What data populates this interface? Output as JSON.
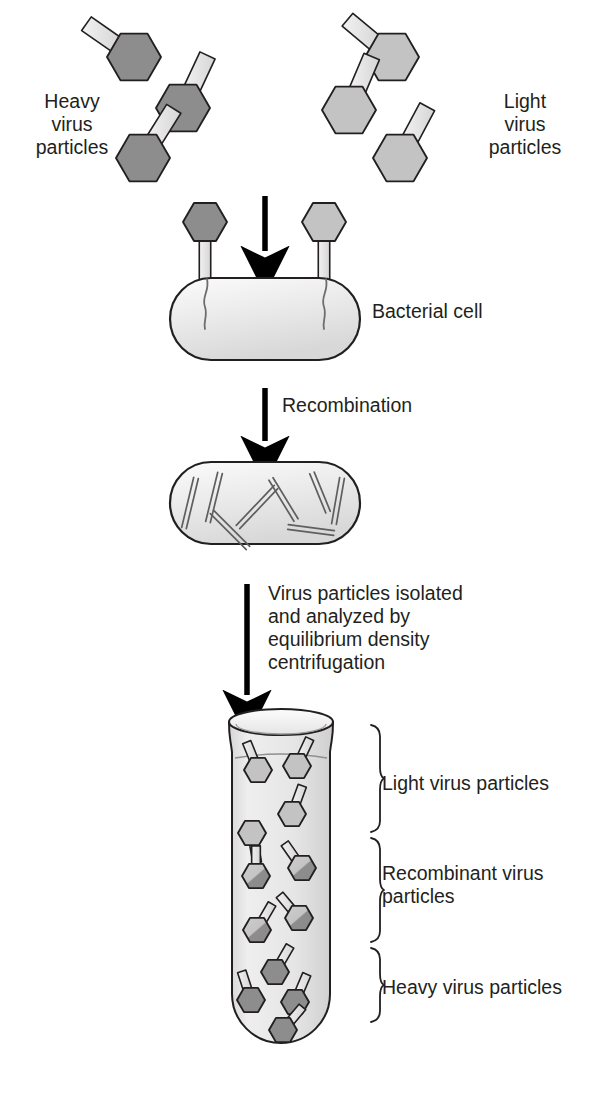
{
  "figure": {
    "background": "#ffffff"
  },
  "colors": {
    "heavy_head": "#8d8d8d",
    "light_head": "#c3c3c3",
    "recombinant_light": "#c9c9c9",
    "recombinant_dark": "#8d8d8d",
    "tail_fill": "#e3e3e3",
    "cell_fill": "#ebebeb",
    "tube_fill": "#e6e6e6",
    "outline": "#231f20",
    "text": "#231f20",
    "arrow": "#000000"
  },
  "labels": {
    "heavy_particles": [
      "Heavy",
      "virus",
      "particles"
    ],
    "light_particles": [
      "Light",
      "virus",
      "particles"
    ],
    "bacterial_cell": "Bacterial cell",
    "recombination": "Recombination",
    "centrifugation": [
      "Virus particles isolated",
      "and analyzed by",
      "equilibrium density",
      "centrifugation"
    ],
    "band_light": [
      "Light virus particles"
    ],
    "band_recombinant": [
      "Recombinant virus",
      "particles"
    ],
    "band_heavy": [
      "Heavy virus particles"
    ]
  },
  "top_particles": {
    "heavy": [
      {
        "cx": 134,
        "cy": 57,
        "r": 27,
        "tail_angle": 215
      },
      {
        "cx": 183,
        "cy": 108,
        "r": 27,
        "tail_angle": 295
      },
      {
        "cx": 143,
        "cy": 158,
        "r": 27,
        "tail_angle": 302
      }
    ],
    "light": [
      {
        "cx": 392,
        "cy": 57,
        "r": 27,
        "tail_angle": 220
      },
      {
        "cx": 349,
        "cy": 110,
        "r": 27,
        "tail_angle": 293
      },
      {
        "cx": 400,
        "cy": 158,
        "r": 27,
        "tail_angle": 298
      }
    ]
  },
  "infection": {
    "cell": {
      "x": 170,
      "y": 278,
      "width": 190,
      "height": 82,
      "label_x": 372,
      "label_y": 318
    },
    "phages": [
      {
        "type": "heavy",
        "cx": 205,
        "cy": 222,
        "r": 22
      },
      {
        "type": "light",
        "cx": 324,
        "cy": 222,
        "r": 22
      }
    ],
    "arrow": {
      "x": 265,
      "y_start": 196,
      "y_end": 262
    }
  },
  "recombination_stage": {
    "cell": {
      "x": 170,
      "y": 462,
      "width": 190,
      "height": 82
    },
    "arrow": {
      "x": 265,
      "y_start": 388,
      "y_end": 452
    },
    "label_x": 282,
    "label_y": 412,
    "dna_segments": [
      {
        "x1": 196,
        "y1": 478,
        "x2": 184,
        "y2": 528
      },
      {
        "x1": 220,
        "y1": 473,
        "x2": 208,
        "y2": 522
      },
      {
        "x1": 212,
        "y1": 512,
        "x2": 248,
        "y2": 548
      },
      {
        "x1": 238,
        "y1": 527,
        "x2": 276,
        "y2": 487
      },
      {
        "x1": 271,
        "y1": 479,
        "x2": 296,
        "y2": 520
      },
      {
        "x1": 288,
        "y1": 527,
        "x2": 334,
        "y2": 533
      },
      {
        "x1": 312,
        "y1": 473,
        "x2": 328,
        "y2": 512
      },
      {
        "x1": 342,
        "y1": 478,
        "x2": 334,
        "y2": 524
      }
    ]
  },
  "centrifugation_stage": {
    "arrow": {
      "x": 247,
      "y_start": 584,
      "y_end": 706
    },
    "label_x": 268,
    "label_y": 600
  },
  "tube": {
    "left": 232,
    "right": 330,
    "rim_y": 722,
    "bottom_y": 1043,
    "rim_rx": 52,
    "rim_ry": 13,
    "bands": [
      {
        "name": "light",
        "y_top": 722,
        "y_bottom": 835,
        "label_y": 784
      },
      {
        "name": "recombinant",
        "y_top": 835,
        "y_bottom": 945,
        "label_y": 884
      },
      {
        "name": "heavy",
        "y_top": 945,
        "y_bottom": 1025,
        "label_y": 988
      }
    ],
    "brace_x": 345,
    "label_x": 382,
    "particles": {
      "light": [
        {
          "cx": 258,
          "cy": 770,
          "r": 14,
          "tail_angle": 248
        },
        {
          "cx": 297,
          "cy": 766,
          "r": 14,
          "tail_angle": 295
        },
        {
          "cx": 292,
          "cy": 814,
          "r": 14,
          "tail_angle": 290
        },
        {
          "cx": 252,
          "cy": 833,
          "r": 14,
          "tail_angle": 80
        }
      ],
      "recombinant": [
        {
          "cx": 256,
          "cy": 876,
          "r": 14,
          "tail_angle": 270
        },
        {
          "cx": 302,
          "cy": 868,
          "r": 14,
          "tail_angle": 235
        },
        {
          "cx": 299,
          "cy": 918,
          "r": 14,
          "tail_angle": 230
        },
        {
          "cx": 257,
          "cy": 930,
          "r": 14,
          "tail_angle": 300
        }
      ],
      "heavy": [
        {
          "cx": 275,
          "cy": 972,
          "r": 14,
          "tail_angle": 300
        },
        {
          "cx": 251,
          "cy": 1000,
          "r": 14,
          "tail_angle": 252
        },
        {
          "cx": 295,
          "cy": 1002,
          "r": 14,
          "tail_angle": 293
        },
        {
          "cx": 283,
          "cy": 1030,
          "r": 14,
          "tail_angle": 310
        }
      ]
    }
  }
}
